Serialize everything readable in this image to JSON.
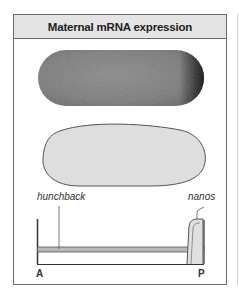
{
  "figure": {
    "title": "Maternal mRNA expression",
    "panels": [
      {
        "name": "stained-embryo",
        "description": "embryo with posterior nanos mRNA staining"
      },
      {
        "name": "outline-embryo",
        "description": "embryo outline uniform hunchback"
      }
    ],
    "diagram": {
      "genes": [
        {
          "label": "hunchback",
          "distribution": "uniform across axis"
        },
        {
          "label": "nanos",
          "distribution": "localized at posterior pole"
        }
      ],
      "axis": {
        "start_label": "A",
        "end_label": "P"
      }
    },
    "colors": {
      "header_bg": "#e4e4e4",
      "border": "#6a6a6a",
      "embryo_stain": "#7a7a7a",
      "embryo_light": "#dcdcdc",
      "band": "#b8b8b8"
    }
  }
}
